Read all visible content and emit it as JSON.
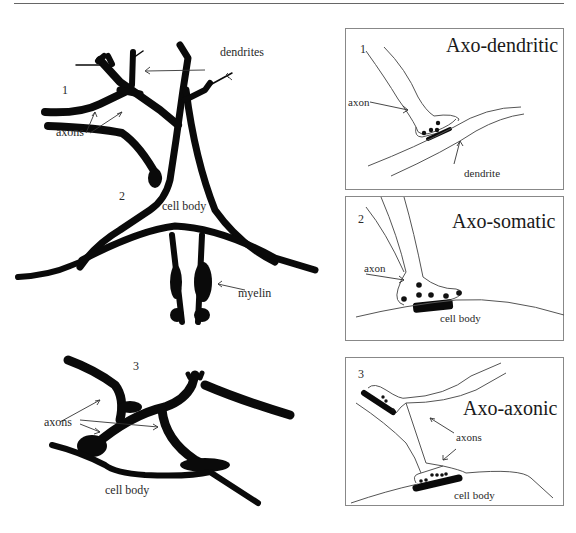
{
  "figure": {
    "type": "synapse-types-diagram",
    "colors": {
      "ink": "#0a0a0a",
      "outline": "#555555",
      "frame": "#888888",
      "background": "#ffffff"
    }
  },
  "left": {
    "neuron_a": {
      "numbers": [
        "1",
        "2"
      ],
      "labels": {
        "dendrites": "dendrites",
        "axons": "axons",
        "cell_body": "cell body",
        "myelin": "myelin"
      }
    },
    "neuron_b": {
      "number": "3",
      "labels": {
        "axons": "axons",
        "cell_body": "cell body"
      }
    }
  },
  "panels": [
    {
      "number": "1",
      "title": "Axo-dendritic",
      "labels": {
        "axon": "axon",
        "target": "dendrite"
      }
    },
    {
      "number": "2",
      "title": "Axo-somatic",
      "labels": {
        "axon": "axon",
        "target": "cell body"
      }
    },
    {
      "number": "3",
      "title": "Axo-axonic",
      "labels": {
        "axon": "axons",
        "target": "cell body"
      }
    }
  ]
}
